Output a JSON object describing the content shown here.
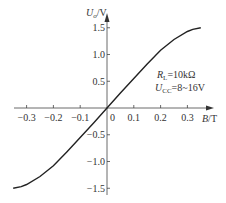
{
  "chart_data": {
    "type": "line",
    "title": "",
    "xlabel": "B/T",
    "ylabel": "U_o/V",
    "xlim": [
      -0.35,
      0.38
    ],
    "ylim": [
      -1.6,
      1.6
    ],
    "x_ticks": [
      "-0.3",
      "-0.2",
      "-0.1",
      "0",
      "0.1",
      "0.2",
      "0.3"
    ],
    "y_ticks": [
      "1.5",
      "1.0",
      "0.5",
      "-0.5",
      "-1.0",
      "-1.5"
    ],
    "grid": false,
    "legend": null,
    "annotations": [
      "R_L=10kΩ",
      "U_CC=8~16V"
    ],
    "series": [
      {
        "name": "Uo vs B",
        "x": [
          -0.35,
          -0.32,
          -0.3,
          -0.25,
          -0.2,
          -0.15,
          -0.1,
          -0.05,
          0,
          0.05,
          0.1,
          0.15,
          0.2,
          0.25,
          0.3,
          0.32,
          0.35
        ],
        "y": [
          -1.5,
          -1.47,
          -1.43,
          -1.28,
          -1.08,
          -0.82,
          -0.55,
          -0.28,
          0,
          0.28,
          0.55,
          0.82,
          1.08,
          1.28,
          1.43,
          1.47,
          1.5
        ]
      }
    ]
  },
  "labels": {
    "y_axis_main": "U",
    "y_axis_sub": "o",
    "y_axis_unit": "/V",
    "x_axis_main": "B",
    "x_axis_unit": "/T",
    "origin": "0",
    "rl_main": "R",
    "rl_sub": "L",
    "rl_value": "=10kΩ",
    "ucc_main": "U",
    "ucc_sub": "CC",
    "ucc_value": "=8~16V"
  }
}
